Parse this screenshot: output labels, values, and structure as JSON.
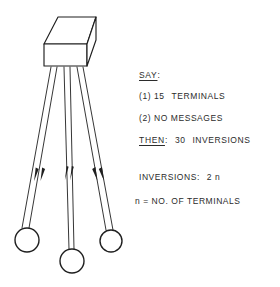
{
  "diagram": {
    "title_alt": "network node with three terminals",
    "stroke_color": "#1f1f1f",
    "background_color": "#ffffff",
    "box": {
      "label": "central-unit",
      "face_fill": "#ffffff"
    },
    "terminals": [
      {
        "name": "terminal-left",
        "cx": 27,
        "cy": 240,
        "r": 12
      },
      {
        "name": "terminal-middle",
        "cx": 72,
        "cy": 261,
        "r": 12
      },
      {
        "name": "terminal-right",
        "cx": 111,
        "cy": 241,
        "r": 11
      }
    ],
    "link_count": 6,
    "arrow_direction": "toward-box"
  },
  "notes": {
    "say_label": "SAY",
    "say_colon": ":",
    "item_1_marker": "(1)",
    "item_1_count": "15",
    "item_1_text": "TERMINALS",
    "item_2_marker": "(2)",
    "item_2_text": "NO  MESSAGES",
    "then_label": "THEN",
    "then_colon": ":",
    "then_count": "30",
    "then_text": "INVERSIONS",
    "inversions_label": "INVERSIONS:",
    "inversions_value": "2 n",
    "n_definition": "n  =  NO. OF  TERMINALS"
  }
}
